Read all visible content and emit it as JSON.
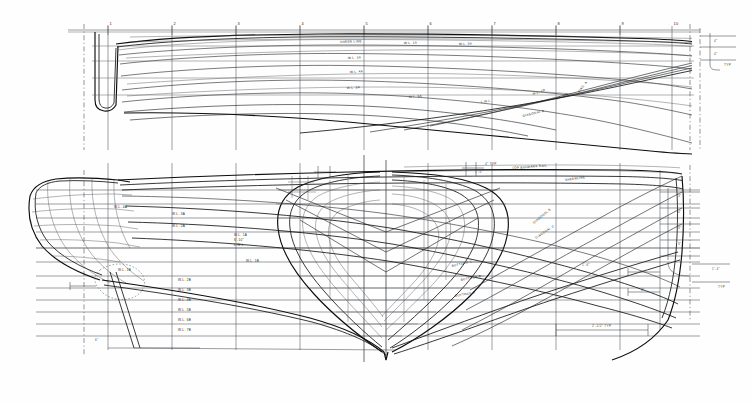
{
  "drawing": {
    "type": "ship-lines-plan",
    "title": "Lines Plan",
    "views": [
      "half-breadth-plan",
      "profile-and-body-plan"
    ],
    "paper_color": "#fefefe",
    "ink_color": "#1a1a1a"
  },
  "stations": {
    "label_prefix": "",
    "top_numbers": [
      "1",
      "2",
      "3",
      "4",
      "5",
      "6",
      "7",
      "8",
      "9",
      "10"
    ],
    "count": 10
  },
  "half_breadth": {
    "labels": [
      {
        "text": "SHEER LINE",
        "x": 340,
        "y": 43,
        "rot": -2
      },
      {
        "text": "W.L. 1A",
        "x": 404,
        "y": 44,
        "rot": -1
      },
      {
        "text": "W.L. 2A",
        "x": 459,
        "y": 45,
        "rot": -1
      },
      {
        "text": "W.L. 3A",
        "x": 348,
        "y": 59,
        "rot": -2
      },
      {
        "text": "W.L. 4A",
        "x": 350,
        "y": 73,
        "rot": -3
      },
      {
        "text": "W.L. 5A",
        "x": 347,
        "y": 89,
        "rot": -4
      },
      {
        "text": "W.L. 6A",
        "x": 409,
        "y": 98,
        "rot": -5
      },
      {
        "text": "L.W.L.",
        "x": 481,
        "y": 103,
        "rot": -7
      },
      {
        "text": "W.L. 1B",
        "x": 533,
        "y": 95,
        "rot": -20
      },
      {
        "text": "W.L. 2B",
        "x": 556,
        "y": 100,
        "rot": -24
      },
      {
        "text": "DIAG. A",
        "x": 579,
        "y": 93,
        "rot": -52
      },
      {
        "text": "DIAGONAL B",
        "x": 523,
        "y": 117,
        "rot": -14
      }
    ]
  },
  "profile": {
    "labels": [
      {
        "text": "TOP BULWARK RAIL",
        "x": 512,
        "y": 169,
        "rot": -4
      },
      {
        "text": "SHEERLINE",
        "x": 565,
        "y": 181,
        "rot": -8
      },
      {
        "text": "W.L. 4A",
        "x": 114,
        "y": 208,
        "rot": 0
      },
      {
        "text": "W.L. 3A",
        "x": 172,
        "y": 215,
        "rot": 0
      },
      {
        "text": "W.L. 2A",
        "x": 172,
        "y": 227,
        "rot": 0
      },
      {
        "text": "W.L. 1A",
        "x": 234,
        "y": 236,
        "rot": 0
      },
      {
        "text": "6'-10\"",
        "x": 234,
        "y": 241,
        "rot": 0
      },
      {
        "text": "L.W.L.",
        "x": 234,
        "y": 246,
        "rot": 0
      },
      {
        "text": "W.L. 1B",
        "x": 246,
        "y": 262,
        "rot": 0
      },
      {
        "text": "W.L. 1B",
        "x": 118,
        "y": 271,
        "rot": 0
      },
      {
        "text": "W.L. 2B",
        "x": 178,
        "y": 281,
        "rot": 0
      },
      {
        "text": "W.L. 3B",
        "x": 178,
        "y": 291,
        "rot": 0
      },
      {
        "text": "W.L. 4B",
        "x": 178,
        "y": 301,
        "rot": 0
      },
      {
        "text": "W.L. 5B",
        "x": 178,
        "y": 311,
        "rot": 0
      },
      {
        "text": "W.L. 6B",
        "x": 178,
        "y": 321,
        "rot": 0
      },
      {
        "text": "W.L. 7B",
        "x": 178,
        "y": 331,
        "rot": 0
      },
      {
        "text": "BUTTOCK C",
        "x": 452,
        "y": 267,
        "rot": -13
      },
      {
        "text": "BUTTOCK B",
        "x": 461,
        "y": 281,
        "rot": -12
      },
      {
        "text": "BUTTOCK A",
        "x": 455,
        "y": 297,
        "rot": -10
      },
      {
        "text": "DIAGONAL B",
        "x": 534,
        "y": 224,
        "rot": -40
      },
      {
        "text": "DIAGONAL C",
        "x": 536,
        "y": 239,
        "rot": -34
      }
    ]
  },
  "dimensions": [
    {
      "text": "4\" TYP",
      "x": 485,
      "y": 165
    },
    {
      "text": "2'-1/2\" TYP",
      "x": 592,
      "y": 327
    },
    {
      "text": "1'-4\"",
      "x": 712,
      "y": 270
    },
    {
      "text": "4\"",
      "x": 641,
      "y": 291
    },
    {
      "text": "TYP",
      "x": 718,
      "y": 288
    },
    {
      "text": "TYP",
      "x": 724,
      "y": 66
    },
    {
      "text": "3\"",
      "x": 678,
      "y": 197
    },
    {
      "text": "4\"",
      "x": 678,
      "y": 213
    },
    {
      "text": "3\"",
      "x": 678,
      "y": 229
    },
    {
      "text": "3\"",
      "x": 678,
      "y": 245
    },
    {
      "text": "6\"",
      "x": 95,
      "y": 341
    },
    {
      "text": "1'-6\"",
      "x": 582,
      "y": 266
    },
    {
      "text": "1'-0\"",
      "x": 475,
      "y": 173
    },
    {
      "text": "4\"",
      "x": 714,
      "y": 42
    },
    {
      "text": "4\"",
      "x": 714,
      "y": 55
    }
  ]
}
